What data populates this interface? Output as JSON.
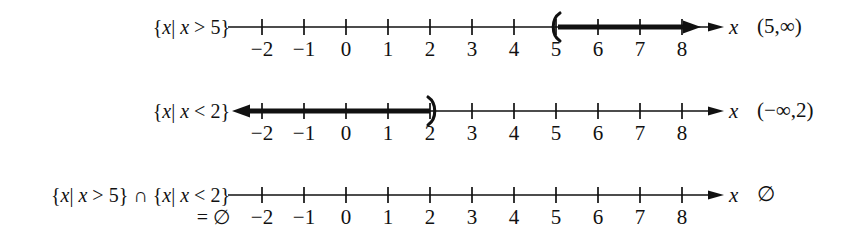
{
  "figure": {
    "background_color": "#ffffff",
    "ink_color": "#111111",
    "variable": "x",
    "axis": {
      "tick_labels": [
        "−2",
        "−1",
        "0",
        "1",
        "2",
        "3",
        "4",
        "5",
        "6",
        "7",
        "8"
      ],
      "tick_values": [
        -2,
        -1,
        0,
        1,
        2,
        3,
        4,
        5,
        6,
        7,
        8
      ],
      "min_label": -2,
      "max_label": 8,
      "pixels_per_unit": 42,
      "origin_px": 346,
      "axis_start_px": 228,
      "axis_end_px": 724
    }
  },
  "rows": [
    {
      "id": "row-greater-than-5",
      "set_builder_label": "{x| x > 5}",
      "set_builder_parts": {
        "open_brace": "{",
        "var1": "x",
        "bar": "|",
        "var2": "x",
        "relation": ">",
        "bound": "5",
        "close_brace": "}"
      },
      "second_line_label": "",
      "variable_label": "x",
      "interval_notation": "(5, ∞)",
      "interval_parts": {
        "left_bracket": "(",
        "left_value": "5",
        "comma": ",",
        "right_value": "∞",
        "right_bracket": ")"
      },
      "graph": {
        "type": "ray",
        "direction": "right",
        "endpoint_value": 5,
        "endpoint_marker": "open-paren",
        "arrow_at_end": true,
        "axis_left_arrow": false,
        "axis_right_arrow": true
      }
    },
    {
      "id": "row-less-than-2",
      "set_builder_label": "{x| x < 2}",
      "set_builder_parts": {
        "open_brace": "{",
        "var1": "x",
        "bar": "|",
        "var2": "x",
        "relation": "<",
        "bound": "2",
        "close_brace": "}"
      },
      "second_line_label": "",
      "variable_label": "x",
      "interval_notation": "(−∞, 2)",
      "interval_parts": {
        "left_bracket": "(",
        "left_value": "−∞",
        "comma": ",",
        "right_value": "2",
        "right_bracket": ")"
      },
      "graph": {
        "type": "ray",
        "direction": "left",
        "endpoint_value": 2,
        "endpoint_marker": "close-paren",
        "arrow_at_end": true,
        "axis_left_arrow": true,
        "axis_right_arrow": true
      }
    },
    {
      "id": "row-intersection-empty",
      "set_builder_label": "{x| x > 5} ∩ {x| x < 2}",
      "set_builder_parts": {
        "open_brace": "{",
        "var1": "x",
        "bar": "|",
        "var2": "x",
        "relation": ">",
        "bound": "5",
        "close_brace": "}",
        "operator": "∩",
        "open_brace_2": "{",
        "var3": "x",
        "bar_2": "|",
        "var4": "x",
        "relation_2": "<",
        "bound_2": "2",
        "close_brace_2": "}"
      },
      "second_line_label": "= ∅",
      "variable_label": "x",
      "interval_notation": "∅",
      "interval_parts": {
        "left_bracket": "",
        "left_value": "∅",
        "comma": "",
        "right_value": "",
        "right_bracket": ""
      },
      "graph": {
        "type": "empty",
        "direction": "none",
        "endpoint_value": null,
        "endpoint_marker": "none",
        "arrow_at_end": false,
        "axis_left_arrow": false,
        "axis_right_arrow": true
      }
    }
  ]
}
